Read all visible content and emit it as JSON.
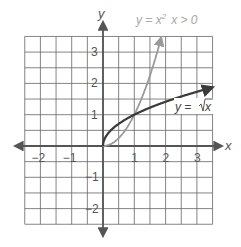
{
  "chart_data": {
    "type": "line",
    "title": "",
    "xlabel": "x",
    "ylabel": "y",
    "xlim": [
      -2.5,
      3.5
    ],
    "ylim": [
      -2.5,
      3.5
    ],
    "grid": true,
    "grid_step": 0.5,
    "x_ticks": [
      "−2",
      "−1",
      "1",
      "2",
      "3"
    ],
    "x_tick_values": [
      -2,
      -1,
      1,
      2,
      3
    ],
    "y_ticks": [
      "3",
      "2",
      "1",
      "−1",
      "−2"
    ],
    "y_tick_values": [
      3,
      2,
      1,
      -1,
      -2
    ],
    "series": [
      {
        "name": "y = x² x > 0",
        "color": "#9a9a9a",
        "x": [
          0,
          0.25,
          0.5,
          0.75,
          1,
          1.25,
          1.5,
          1.75,
          1.87
        ],
        "values": [
          0,
          0.0625,
          0.25,
          0.5625,
          1,
          1.5625,
          2.25,
          3.0625,
          3.5
        ]
      },
      {
        "name": "y = √x",
        "color": "#3a3a3a",
        "x": [
          0,
          0.0625,
          0.25,
          0.5,
          1,
          1.5,
          2,
          2.5,
          3,
          3.5
        ],
        "values": [
          0,
          0.25,
          0.5,
          0.707,
          1,
          1.225,
          1.414,
          1.581,
          1.732,
          1.871
        ]
      }
    ],
    "annotations": [
      {
        "text": "y = x² x > 0",
        "near": "top of parabola"
      },
      {
        "text": "y = √x",
        "near": "right end of root curve"
      }
    ]
  },
  "labels": {
    "x_axis": "x",
    "y_axis": "y",
    "parabola_label_main": "y = x",
    "parabola_label_sup": "2",
    "parabola_label_cond": "x > 0",
    "sqrt_label_y": "y = ",
    "sqrt_label_x": "x"
  }
}
